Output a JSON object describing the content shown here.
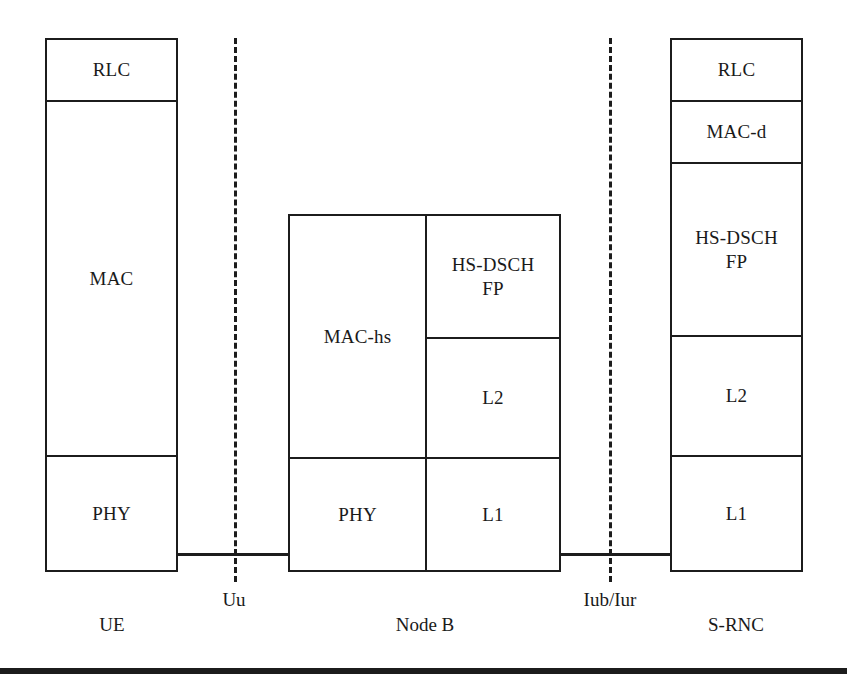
{
  "figure": {
    "kind": "protocol-stack-diagram",
    "background_color": "#ffffff",
    "line_color": "#1c1c1c",
    "text_color": "#1a1a1a"
  },
  "stacks": [
    {
      "id": "ue",
      "caption": "UE",
      "layers": [
        {
          "id": "ue-rlc",
          "label": "RLC"
        },
        {
          "id": "ue-mac",
          "label": "MAC"
        },
        {
          "id": "ue-phy",
          "label": "PHY"
        }
      ]
    },
    {
      "id": "node-b",
      "caption": "Node B",
      "layers": [
        {
          "id": "nodeb-mac-hs",
          "label": "MAC-hs"
        },
        {
          "id": "nodeb-hs-dsch-fp",
          "label": "HS-DSCH\nFP"
        },
        {
          "id": "nodeb-l2",
          "label": "L2"
        },
        {
          "id": "nodeb-phy",
          "label": "PHY"
        },
        {
          "id": "nodeb-l1",
          "label": "L1"
        }
      ]
    },
    {
      "id": "s-rnc",
      "caption": "S-RNC",
      "layers": [
        {
          "id": "srnc-rlc",
          "label": "RLC"
        },
        {
          "id": "srnc-mac-d",
          "label": "MAC-d"
        },
        {
          "id": "srnc-hs-dsch-fp",
          "label": "HS-DSCH\nFP"
        },
        {
          "id": "srnc-l2",
          "label": "L2"
        },
        {
          "id": "srnc-l1",
          "label": "L1"
        }
      ]
    }
  ],
  "interfaces": [
    {
      "id": "uu",
      "label": "Uu"
    },
    {
      "id": "iub-iur",
      "label": "Iub/Iur"
    }
  ]
}
